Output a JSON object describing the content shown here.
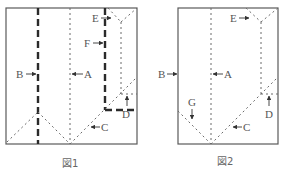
{
  "figures": [
    {
      "caption": "図1",
      "labels": {
        "A": "A",
        "B": "B",
        "C": "C",
        "D": "D",
        "E": "E",
        "F": "F"
      }
    },
    {
      "caption": "図2",
      "labels": {
        "A": "A",
        "B": "B",
        "C": "C",
        "D": "D",
        "E": "E",
        "G": "G"
      }
    }
  ],
  "colors": {
    "frame": "#5a5a5a",
    "thick_line": "#2a2a2a",
    "thin_line": "#6a6a6a",
    "text": "#555555"
  }
}
